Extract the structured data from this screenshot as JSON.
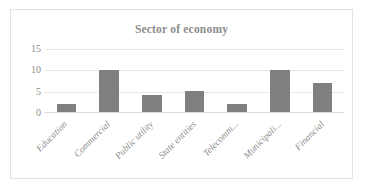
{
  "chart_data": {
    "type": "bar",
    "title": "Sector of economy",
    "xlabel": "",
    "ylabel": "",
    "categories": [
      "Education",
      "Commercial",
      "Public utility",
      "State entities",
      "Telecomm...",
      "Municipali...",
      "Financial"
    ],
    "values": [
      2,
      10,
      4,
      5,
      2,
      10,
      7
    ],
    "ylim": [
      0,
      15
    ],
    "yticks": [
      "0",
      "5",
      "10",
      "15"
    ],
    "ytick_values": [
      0,
      5,
      10,
      15
    ],
    "grid": true,
    "legend": "none",
    "bar_color": "#808080",
    "gridline_color": "#e9e9e9",
    "axis_color": "#d9d9d9",
    "text_color": "#8c8c8c",
    "border_color": "#e2e2e2"
  }
}
